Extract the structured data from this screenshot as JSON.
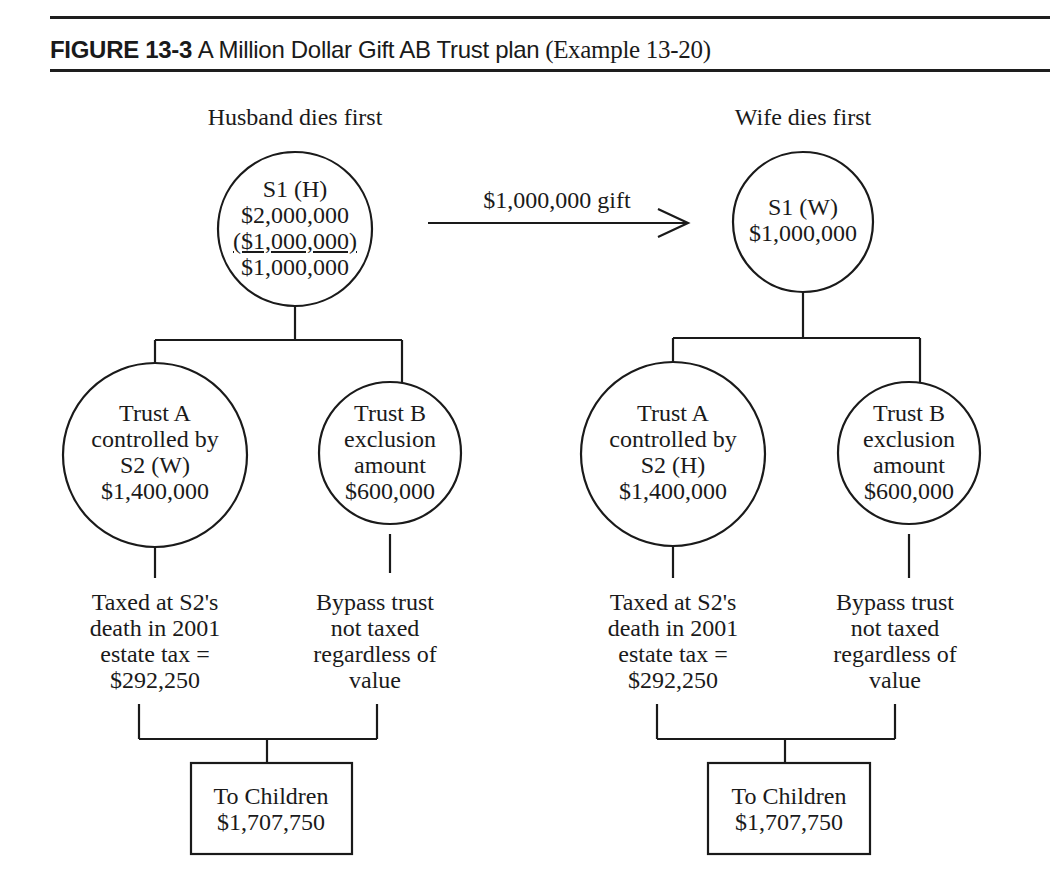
{
  "header": {
    "figure_label": "FIGURE 13-3",
    "title_sans": "A Million Dollar Gift  AB Trust plan",
    "title_serif": "(Example 13-20)"
  },
  "gift_arrow": {
    "label": "$1,000,000 gift"
  },
  "scenarios": [
    {
      "heading": "Husband dies first",
      "root": {
        "lines": [
          "S1 (H)",
          "$2,000,000",
          "($1,000,000)",
          "$1,000,000"
        ]
      },
      "trust_a": {
        "lines": [
          "Trust A",
          "controlled by",
          "S2 (W)",
          "$1,400,000"
        ]
      },
      "trust_b": {
        "lines": [
          "Trust B",
          "exclusion",
          "amount",
          "$600,000"
        ]
      },
      "trust_a_note": {
        "lines": [
          "Taxed at S2's",
          "death in 2001",
          "estate tax =",
          "$292,250"
        ]
      },
      "trust_b_note": {
        "lines": [
          "Bypass trust",
          "not taxed",
          "regardless of",
          "value"
        ]
      },
      "children": {
        "lines": [
          "To Children",
          "$1,707,750"
        ]
      }
    },
    {
      "heading": "Wife dies first",
      "root": {
        "lines": [
          "S1 (W)",
          "$1,000,000"
        ]
      },
      "trust_a": {
        "lines": [
          "Trust A",
          "controlled by",
          "S2 (H)",
          "$1,400,000"
        ]
      },
      "trust_b": {
        "lines": [
          "Trust B",
          "exclusion",
          "amount",
          "$600,000"
        ]
      },
      "trust_a_note": {
        "lines": [
          "Taxed at S2's",
          "death in 2001",
          "estate tax =",
          "$292,250"
        ]
      },
      "trust_b_note": {
        "lines": [
          "Bypass trust",
          "not taxed",
          "regardless of",
          "value"
        ]
      },
      "children": {
        "lines": [
          "To Children",
          "$1,707,750"
        ]
      }
    }
  ],
  "colors": {
    "ink": "#1a1a1a",
    "background": "#ffffff"
  }
}
